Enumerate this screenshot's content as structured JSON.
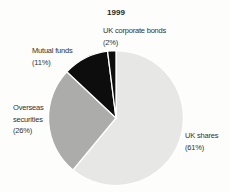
{
  "background": "#fdfdfc",
  "title": "1999",
  "chart_data": {
    "type": "pie",
    "title": "1999",
    "unit": "percent",
    "direction": "clockwise",
    "start_angle_deg": 0,
    "legend_position": "none",
    "separator_color": "#ffffff",
    "slices": [
      {
        "id": "uk-shares",
        "label": "UK shares",
        "value": 61,
        "color": "#e7e7e6"
      },
      {
        "id": "overseas-securities",
        "label": "Overseas securities",
        "value": 26,
        "color": "#acacab"
      },
      {
        "id": "mutual-funds",
        "label": "Mutual funds",
        "value": 11,
        "color": "#0d0d0d"
      },
      {
        "id": "uk-corporate-bonds",
        "label": "UK corporate bonds",
        "value": 2,
        "color": "#0d0d0d"
      }
    ]
  },
  "labels": {
    "uk_corporate_bonds": {
      "lines": [
        "UK corporate bonds",
        "(2%)"
      ]
    },
    "mutual_funds": {
      "lines": [
        "Mutual funds",
        "(11%)"
      ]
    },
    "overseas_securities": {
      "lines": [
        "Overseas",
        "securities",
        "(26%)"
      ]
    },
    "uk_shares": {
      "lines": [
        "UK shares",
        "(61%)"
      ]
    }
  }
}
